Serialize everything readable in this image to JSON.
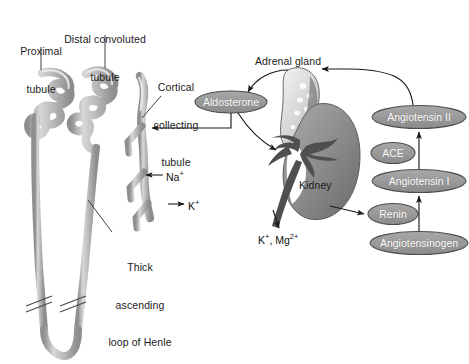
{
  "figure": {
    "background_color": "#ffffff",
    "text_color": "#1a1a1a",
    "oval_fill": "#999999",
    "oval_stroke": "#4d4d4d",
    "oval_text_color": "#ffffff",
    "tubule_fill": "#c8c8c8",
    "tubule_stroke": "#6e6e6e",
    "kidney_fill": "#8a8a8a",
    "adrenal_fill": "#d9d9d9",
    "vessel_fill": "#4f4f4f",
    "arrow_color": "#1a1a1a"
  },
  "nephron_labels": [
    {
      "id": "proximal-tubule",
      "lines": [
        "Proximal",
        "tubule"
      ],
      "x": 16,
      "y": 20
    },
    {
      "id": "distal-convoluted-tubule",
      "lines": [
        "Distal convoluted",
        "tubule"
      ],
      "x": 62,
      "y": 8
    },
    {
      "id": "cortical-collecting-tubule",
      "lines": [
        "Cortical",
        "collecting",
        "tubule"
      ],
      "x": 148,
      "y": 56
    },
    {
      "id": "thick-ascending-loop-of-henle",
      "lines": [
        "Thick",
        "ascending",
        "loop of Henle"
      ],
      "x": 98,
      "y": 236
    }
  ],
  "ion_labels": [
    {
      "id": "sodium-ion",
      "text": "Na",
      "charge": "+",
      "x": 165,
      "y": 170
    },
    {
      "id": "potassium-ion",
      "text": "K",
      "charge": "+",
      "x": 187,
      "y": 199
    },
    {
      "id": "potassium-magnesium-ions",
      "text": "K+, Mg2+",
      "x": 258,
      "y": 233
    }
  ],
  "anatomy_labels": [
    {
      "id": "adrenal-gland",
      "text": "Adrenal gland",
      "x": 255,
      "y": 55
    },
    {
      "id": "kidney",
      "text": "Kidney",
      "x": 299,
      "y": 179
    }
  ],
  "ovals": [
    {
      "id": "aldosterone",
      "label": "Aldosterone",
      "cx": 231,
      "cy": 102,
      "rx": 36,
      "ry": 11
    },
    {
      "id": "angiotensin-ii",
      "label": "Angiotensin II",
      "cx": 419,
      "cy": 117,
      "rx": 47,
      "ry": 11.5
    },
    {
      "id": "ace",
      "label": "ACE",
      "cx": 393,
      "cy": 153,
      "rx": 22,
      "ry": 10.5
    },
    {
      "id": "angiotensin-i",
      "label": "Angiotensin I",
      "cx": 419,
      "cy": 181,
      "rx": 47,
      "ry": 11.5
    },
    {
      "id": "renin",
      "label": "Renin",
      "cx": 393,
      "cy": 214,
      "rx": 25,
      "ry": 10.5
    },
    {
      "id": "angiotensinogen",
      "label": "Angiotensinogen",
      "cx": 419,
      "cy": 243,
      "rx": 49,
      "ry": 11.5
    }
  ],
  "pathways": [
    {
      "id": "angiotensinogen-to-angiotensin-i",
      "from": "angiotensinogen",
      "to": "angiotensin-i",
      "mediator": "renin"
    },
    {
      "id": "angiotensin-i-to-angiotensin-ii",
      "from": "angiotensin-i",
      "to": "angiotensin-ii",
      "mediator": "ace"
    },
    {
      "id": "angiotensin-ii-to-adrenal-gland",
      "from": "angiotensin-ii",
      "to": "adrenal-gland"
    },
    {
      "id": "adrenal-gland-to-aldosterone",
      "from": "adrenal-gland",
      "to": "aldosterone"
    },
    {
      "id": "aldosterone-to-kidney",
      "from": "aldosterone",
      "to": "kidney"
    },
    {
      "id": "aldosterone-to-collecting-tubule",
      "from": "aldosterone",
      "to": "cortical-collecting-tubule"
    },
    {
      "id": "kidney-to-renin",
      "from": "kidney",
      "to": "renin"
    },
    {
      "id": "kidney-excretes-k-mg",
      "from": "kidney",
      "to": "potassium-magnesium-ions"
    }
  ]
}
